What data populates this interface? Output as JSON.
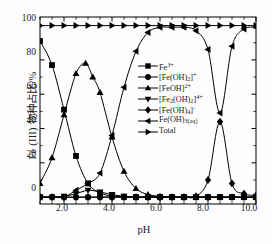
{
  "chart_data": {
    "type": "line",
    "title": "",
    "xlabel": "pH",
    "ylabel": "Fe (III) 物种占比/%",
    "xlim": [
      1.0,
      10.0
    ],
    "ylim": [
      -4,
      105
    ],
    "xticks": [
      "2.0",
      "4.0",
      "6.0",
      "8.0",
      "10.0"
    ],
    "xtick_values": [
      2.0,
      4.0,
      6.0,
      8.0,
      10.0
    ],
    "yticks": [
      "0",
      "20",
      "40",
      "60",
      "80",
      "100"
    ],
    "ytick_values": [
      0,
      20,
      40,
      60,
      80,
      100
    ],
    "grid": false,
    "legend_position": "center",
    "series": [
      {
        "name": "Fe3+",
        "label_html": "Fe<sup>3+</sup>",
        "marker": "square",
        "x": [
          1.0,
          1.5,
          2.0,
          2.5,
          3.0,
          3.5,
          4.0,
          4.5,
          5.0,
          5.5,
          6.0,
          6.5,
          7.0,
          7.5,
          8.0,
          8.5,
          9.0,
          9.5,
          10.0
        ],
        "y": [
          91,
          77,
          51,
          24,
          8,
          2.5,
          0.6,
          0.2,
          0,
          0,
          0,
          0,
          0,
          0,
          0,
          0,
          0,
          0,
          0
        ]
      },
      {
        "name": "Fe(OH)2+",
        "label_html": "[Fe(OH)<sub>2</sub>]<sup>+</sup>",
        "marker": "circle",
        "x": [
          1.0,
          1.5,
          2.0,
          2.5,
          3.0,
          3.5,
          4.0,
          4.5,
          5.0,
          5.5,
          6.0,
          6.5,
          7.0,
          7.5,
          8.0,
          8.5,
          9.0,
          9.5,
          10.0
        ],
        "y": [
          0,
          0,
          0,
          0,
          0,
          0,
          0,
          0,
          0,
          0,
          0,
          0,
          0,
          0,
          0,
          0,
          0,
          0,
          0
        ]
      },
      {
        "name": "FeOH2+",
        "label_html": "[FeOH]<sup>2+</sup>",
        "marker": "triangle-up",
        "x": [
          1.0,
          1.5,
          2.0,
          2.5,
          2.9,
          3.2,
          3.5,
          4.0,
          4.5,
          5.0,
          5.5,
          6.0,
          6.5,
          7.0,
          7.5,
          8.0,
          8.5,
          9.0,
          9.5,
          10.0
        ],
        "y": [
          8,
          23,
          48,
          72,
          78,
          70,
          61,
          35,
          15,
          5,
          1.5,
          0.5,
          0,
          0,
          0,
          0,
          0,
          0,
          0,
          0
        ]
      },
      {
        "name": "Fe2(OH)2 4+",
        "label_html": "[Fe<sub>2</sub>(OH)<sub>2</sub>]<sup>4+</sup>",
        "marker": "triangle-down",
        "x": [
          1.0,
          1.5,
          2.0,
          2.5,
          3.0,
          3.5,
          4.0,
          4.5,
          5.0,
          5.5,
          6.0,
          6.5,
          7.0,
          7.5,
          8.0,
          8.5,
          9.0,
          9.5,
          10.0
        ],
        "y": [
          0,
          0,
          0.5,
          2,
          4,
          3,
          1.5,
          0.5,
          0,
          0,
          0,
          0,
          0,
          0,
          0,
          0,
          0,
          0,
          0
        ]
      },
      {
        "name": "Fe(OH)4-",
        "label_html": "[Fe(OH)<sub>4</sub>]<sup>-</sup>",
        "marker": "diamond",
        "x": [
          1.0,
          1.5,
          2.0,
          2.5,
          3.0,
          3.5,
          4.0,
          4.5,
          5.0,
          5.5,
          6.0,
          6.5,
          7.0,
          7.5,
          8.0,
          8.5,
          9.0,
          9.5,
          10.0
        ],
        "y": [
          0,
          0,
          0,
          0,
          0,
          0,
          0,
          0,
          0,
          0,
          0,
          0,
          0,
          0.5,
          10,
          44,
          8,
          2,
          1
        ]
      },
      {
        "name": "Fe(OH)3(aq)",
        "label_html": "Fe(OH)<sub>3(aq)</sub>",
        "marker": "triangle-left",
        "x": [
          1.0,
          1.5,
          2.0,
          2.5,
          3.0,
          3.5,
          4.0,
          4.5,
          5.0,
          5.5,
          6.0,
          6.5,
          7.0,
          7.5,
          8.0,
          8.5,
          9.0,
          9.5,
          10.0
        ],
        "y": [
          0,
          0,
          0,
          4,
          8,
          14,
          36,
          64,
          85,
          96,
          99,
          99,
          99,
          97,
          86,
          49,
          88,
          98,
          99
        ]
      },
      {
        "name": "Total",
        "label_html": "Total",
        "marker": "triangle-right",
        "x": [
          1.0,
          1.5,
          2.0,
          2.5,
          3.0,
          3.5,
          4.0,
          4.5,
          5.0,
          5.5,
          6.0,
          6.5,
          7.0,
          7.5,
          8.0,
          8.5,
          9.0,
          9.5,
          10.0
        ],
        "y": [
          100,
          100,
          100,
          100,
          100,
          100,
          100,
          100,
          100,
          100,
          100,
          100,
          100,
          100,
          100,
          100,
          100,
          100,
          100
        ]
      }
    ],
    "legend_entries": [
      "Fe3+",
      "[Fe(OH)2]+",
      "[FeOH]2+",
      "[Fe2(OH)2]4+",
      "[Fe(OH)4]-",
      "Fe(OH)3(aq)",
      "Total"
    ],
    "line_color": "#000000"
  }
}
